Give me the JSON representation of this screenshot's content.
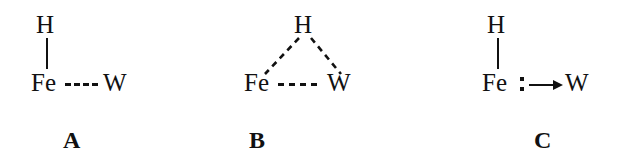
{
  "figure": {
    "background_color": "#ffffff",
    "ink_color": "#111111"
  },
  "structures": [
    {
      "id": "A",
      "caption": "A",
      "atoms": {
        "hydrogen": "H",
        "iron": "Fe",
        "tungsten": "W"
      },
      "bonds": [
        {
          "name": "H-Fe",
          "style": "solid",
          "orientation": "vertical"
        },
        {
          "name": "Fe-W",
          "style": "dashed",
          "orientation": "horizontal",
          "dash_count": 4
        }
      ]
    },
    {
      "id": "B",
      "caption": "B",
      "atoms": {
        "hydrogen": "H",
        "iron": "Fe",
        "tungsten": "W"
      },
      "bonds": [
        {
          "name": "H-Fe",
          "style": "dashed",
          "orientation": "diagonal"
        },
        {
          "name": "H-W",
          "style": "dashed",
          "orientation": "diagonal"
        },
        {
          "name": "Fe-W",
          "style": "dashed",
          "orientation": "horizontal",
          "dash_count": 4
        }
      ]
    },
    {
      "id": "C",
      "caption": "C",
      "atoms": {
        "hydrogen": "H",
        "iron": "Fe",
        "tungsten": "W"
      },
      "bonds": [
        {
          "name": "H-Fe",
          "style": "solid",
          "orientation": "vertical"
        },
        {
          "name": "Fe-W",
          "style": "arrow",
          "orientation": "horizontal",
          "lone_pair_dots": 2
        }
      ]
    }
  ]
}
